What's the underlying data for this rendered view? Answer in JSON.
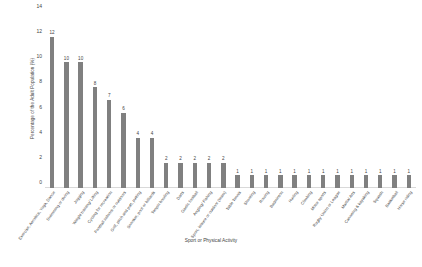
{
  "chart_data": {
    "type": "bar",
    "title": "",
    "xlabel": "Sport or Physical Activity",
    "ylabel": "Percentage of the Adult Population (%)",
    "ylim": [
      0,
      14
    ],
    "yticks": [
      0,
      2,
      4,
      6,
      8,
      10,
      12,
      14
    ],
    "grid": false,
    "legend": null,
    "bar_color": "#808080",
    "categories": [
      "Exercise, Aerobics, Yoga, Dance",
      "Swimming or diving",
      "Jogging",
      "Weight training/ Lifting",
      "Cycling for recreation",
      "Football indoors or outdoors",
      "Golf, pitch and putt, putting",
      "Snooker, pool or billiards",
      "Tenpin bowling",
      "Darts",
      "Gaelic football",
      "Angling/ Fishing",
      "Sport, leisure or outdoor (team)",
      "Table Tennis",
      "Shooting",
      "Rowing",
      "Badminton",
      "Hurling",
      "Climbing",
      "Motor sports",
      "Rugby Union or League",
      "Martial Arts",
      "Canoeing & kayaking",
      "Squash",
      "Basketball",
      "Horse riding"
    ],
    "values": [
      12,
      10,
      10,
      8,
      7,
      6,
      4,
      4,
      2,
      2,
      2,
      2,
      2,
      1,
      1,
      1,
      1,
      1,
      1,
      1,
      1,
      1,
      1,
      1,
      1,
      1
    ],
    "value_labels": [
      "12",
      "10",
      "10",
      "8",
      "7",
      "6",
      "4",
      "4",
      "2",
      "2",
      "2",
      "2",
      "2",
      "1",
      "1",
      "1",
      "1",
      "1",
      "1",
      "1",
      "1",
      "1",
      "1",
      "1",
      "1",
      "1"
    ],
    "ytick_labels": [
      "0",
      "2",
      "4",
      "6",
      "8",
      "10",
      "12",
      "14"
    ]
  }
}
